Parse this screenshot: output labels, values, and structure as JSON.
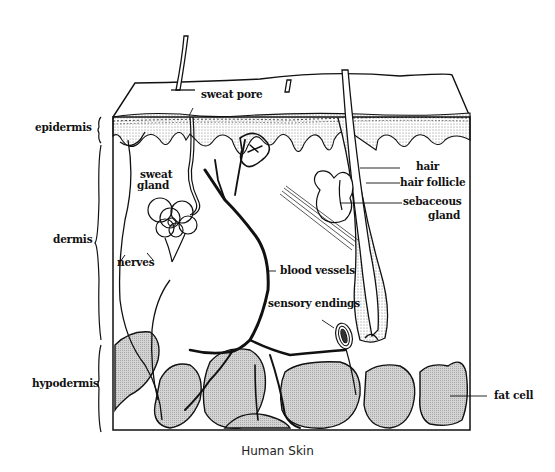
{
  "figure": {
    "title": "Human Skin",
    "colors": {
      "ink": "#111111",
      "fat_fill": "#c9c9c9",
      "epidermis_fill": "#e8e8e8",
      "background": "#ffffff"
    }
  },
  "layers": {
    "epidermis": "epidermis",
    "dermis": "dermis",
    "hypodermis": "hypodermis"
  },
  "labels": {
    "sweat_pore": "sweat pore",
    "sweat_gland_1": "sweat",
    "sweat_gland_2": "gland",
    "nerves": "nerves",
    "blood_vessels": "blood vessels",
    "sensory_endings": "sensory endings",
    "hair": "hair",
    "hair_follicle": "hair follicle",
    "sebaceous_1": "sebaceous",
    "sebaceous_2": "gland",
    "fat_cell": "fat cell"
  }
}
